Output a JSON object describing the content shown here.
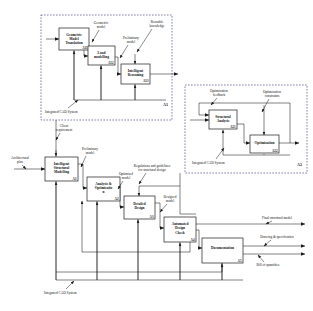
{
  "diagram": {
    "type": "idef0-process-diagram",
    "background_color": "#ffffff",
    "line_color": "#1a1a1a",
    "module_frame_color": "#2b2b6e"
  },
  "modules": [
    {
      "id": "A1",
      "name": "Intelligent Structural Modelling",
      "frame": {
        "x": 41,
        "y": 15,
        "w": 131,
        "h": 105
      },
      "mechanism_label": "Integrated CAD System",
      "boxes": [
        {
          "id": "A11",
          "title_lines": [
            "Geometric",
            "Model",
            "Translation"
          ],
          "x": 59,
          "y": 28,
          "w": 30,
          "h": 22
        },
        {
          "id": "A12",
          "title_lines": [
            "Load",
            "modelling"
          ],
          "x": 88,
          "y": 46,
          "w": 27,
          "h": 19
        },
        {
          "id": "A13",
          "title_lines": [
            "Intelligent",
            "Reasoning"
          ],
          "x": 121,
          "y": 64,
          "w": 29,
          "h": 20
        }
      ],
      "arrow_labels": [
        {
          "text_lines": [
            "Geometric",
            "model"
          ],
          "x": 101,
          "y": 25
        },
        {
          "text_lines": [
            "Preliminary",
            "model"
          ],
          "x": 130,
          "y": 40
        },
        {
          "text_lines": [
            "Reusable",
            "knowledge"
          ],
          "x": 157,
          "y": 24
        }
      ]
    },
    {
      "id": "A2",
      "name": "Analysis & Optimisation",
      "frame": {
        "x": 185,
        "y": 85,
        "w": 122,
        "h": 88
      },
      "mechanism_label": "Integrated CAD System",
      "boxes": [
        {
          "id": "A21",
          "title_lines": [
            "Structural",
            "Analysis"
          ],
          "x": 209,
          "y": 110,
          "w": 28,
          "h": 19
        },
        {
          "id": "A22",
          "title_lines": [
            "Optimization"
          ],
          "x": 250,
          "y": 135,
          "w": 29,
          "h": 18
        }
      ],
      "arrow_labels": [
        {
          "text_lines": [
            "Optimization",
            "feedback"
          ],
          "x": 219,
          "y": 93
        },
        {
          "text_lines": [
            "Optimization",
            "constraints"
          ],
          "x": 272,
          "y": 94
        }
      ]
    }
  ],
  "main_flow": {
    "boxes": [
      {
        "id": "A1",
        "title_lines": [
          "Intelligent",
          "Structural",
          "Modelling"
        ],
        "x": 45,
        "y": 157,
        "w": 33,
        "h": 24
      },
      {
        "id": "A2",
        "title_lines": [
          "Analysis &",
          "Optimisatio",
          "n"
        ],
        "x": 87,
        "y": 177,
        "w": 33,
        "h": 24
      },
      {
        "id": "A3",
        "title_lines": [
          "Detailed",
          "Design"
        ],
        "x": 124,
        "y": 196,
        "w": 31,
        "h": 23
      },
      {
        "id": "A4",
        "title_lines": [
          "Automated",
          "Design",
          "Check"
        ],
        "x": 164,
        "y": 217,
        "w": 32,
        "h": 25
      },
      {
        "id": "A5",
        "title_lines": [
          "Documentation"
        ],
        "x": 202,
        "y": 238,
        "w": 41,
        "h": 25
      }
    ],
    "input_labels": [
      {
        "text_lines": [
          "Architectural",
          "plan"
        ],
        "x": 20,
        "y": 157
      },
      {
        "text_lines": [
          "Client",
          "requirement"
        ],
        "x": 62,
        "y": 127
      }
    ],
    "intermediate_labels": [
      {
        "text_lines": [
          "Preliminary",
          "model"
        ],
        "x": 88,
        "y": 150
      },
      {
        "text_lines": [
          "Optimised",
          "model"
        ],
        "x": 123,
        "y": 175
      },
      {
        "text_lines": [
          "Regulations and guidelines",
          "for structural design"
        ],
        "x": 152,
        "y": 168
      },
      {
        "text_lines": [
          "Designed",
          "model"
        ],
        "x": 167,
        "y": 198
      }
    ],
    "output_labels": [
      {
        "text_lines": [
          "Final structural model"
        ],
        "x": 275,
        "y": 224
      },
      {
        "text_lines": [
          "Drawing & specification"
        ],
        "x": 275,
        "y": 243
      },
      {
        "text_lines": [
          "Bill of quantities"
        ],
        "x": 268,
        "y": 266
      }
    ],
    "mechanism_label": "Integrated CAD System"
  }
}
